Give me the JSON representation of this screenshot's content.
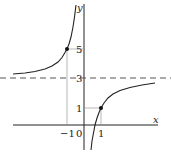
{
  "figure": {
    "function": "y = 3 + 2/x",
    "axes": {
      "x_label": "x",
      "y_label": "y"
    },
    "ticks": {
      "x": [
        {
          "value": -1,
          "label": "-1"
        },
        {
          "value": 0,
          "label": "0"
        },
        {
          "value": 1,
          "label": "1"
        }
      ],
      "y": [
        {
          "value": 1,
          "label": "1"
        },
        {
          "value": 3,
          "label": "3"
        },
        {
          "value": 5,
          "label": "5"
        }
      ]
    },
    "asymptote": {
      "horizontal_y": 3,
      "vertical_x": 0,
      "style": "dashed"
    },
    "points": [
      {
        "x": -1,
        "y": 5
      },
      {
        "x": 1,
        "y": 1
      }
    ],
    "colors": {
      "curve": "#222222",
      "axis": "#222222",
      "guide": "#999999",
      "asymptote": "#555555"
    }
  }
}
